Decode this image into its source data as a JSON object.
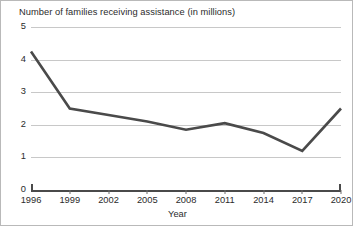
{
  "chart_data": {
    "type": "line",
    "title": "Number of families receiving assistance (in millions)",
    "xlabel": "Year",
    "ylabel": "",
    "categories": [
      "1996",
      "1999",
      "2002",
      "2005",
      "2008",
      "2011",
      "2014",
      "2017",
      "2020"
    ],
    "x": [
      1996,
      1999,
      2002,
      2005,
      2008,
      2011,
      2014,
      2017,
      2020
    ],
    "values": [
      4.25,
      2.5,
      2.3,
      2.1,
      1.85,
      2.05,
      1.75,
      1.2,
      2.5
    ],
    "series": [
      {
        "name": "Families receiving assistance",
        "values": [
          4.25,
          2.5,
          2.3,
          2.1,
          1.85,
          2.05,
          1.75,
          1.2,
          2.5
        ]
      }
    ],
    "ylim": [
      0,
      5
    ],
    "yticks": [
      0,
      1,
      2,
      3,
      4,
      5
    ],
    "ytick_labels": [
      "0",
      "1",
      "2",
      "3",
      "4",
      "5"
    ],
    "xlim": [
      1996,
      2020
    ],
    "grid": "horizontal",
    "legend": "none",
    "line_color": "#4a4a4a",
    "grid_color": "#c8c8c8",
    "axis_color": "#4a4a4a",
    "background_color": "#ffffff",
    "text_color": "#2b2b2b"
  }
}
